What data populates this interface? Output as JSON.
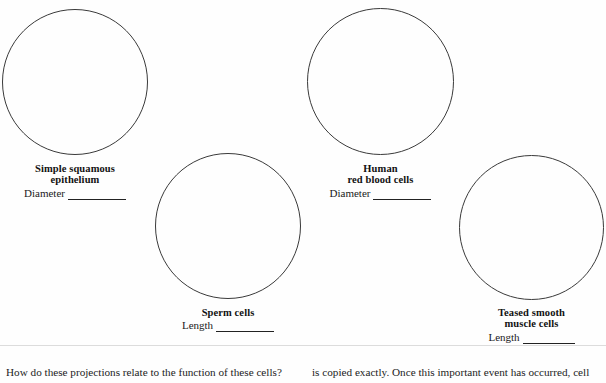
{
  "page": {
    "background_color": "#fefefe",
    "ink_color": "#1a1a1a",
    "circle_stroke_color": "#3a3a3a"
  },
  "cells": [
    {
      "id": "simple-squamous-epithelium",
      "title_line1": "Simple squamous",
      "title_line2": "epithelium",
      "measure_label": "Diameter",
      "measure_value": "",
      "circle": {
        "left": 2,
        "top": 9,
        "size": 146
      },
      "label": {
        "left": 2,
        "top": 163,
        "width": 146
      }
    },
    {
      "id": "human-red-blood-cells",
      "title_line1": "Human",
      "title_line2": "red blood cells",
      "measure_label": "Diameter",
      "measure_value": "",
      "circle": {
        "left": 307,
        "top": 8,
        "size": 147
      },
      "label": {
        "left": 307,
        "top": 163,
        "width": 147
      }
    },
    {
      "id": "sperm-cells",
      "title_line1": "Sperm cells",
      "title_line2": "",
      "measure_label": "Length",
      "measure_value": "",
      "circle": {
        "left": 155,
        "top": 153,
        "size": 146
      },
      "label": {
        "left": 155,
        "top": 307,
        "width": 146
      }
    },
    {
      "id": "teased-smooth-muscle-cells",
      "title_line1": "Teased smooth",
      "title_line2": "muscle cells",
      "measure_label": "Length",
      "measure_value": "",
      "circle": {
        "left": 459,
        "top": 155,
        "size": 145
      },
      "label": {
        "left": 459,
        "top": 307,
        "width": 145
      }
    }
  ],
  "bottom_text": {
    "left_column": "How do these projections relate to the function of these cells?",
    "right_column": "is copied exactly. Once this important event has occurred, cell"
  }
}
